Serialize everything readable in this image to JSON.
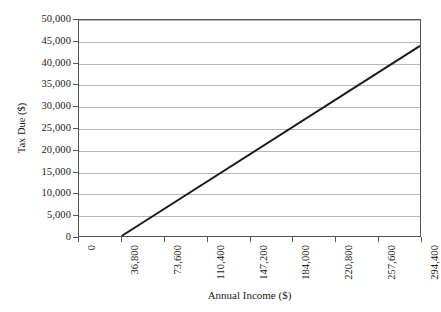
{
  "chart_data": {
    "type": "line",
    "title": "",
    "xlabel": "Annual Income ($)",
    "ylabel": "Tax Due ($)",
    "xlim": [
      0,
      294400
    ],
    "ylim": [
      0,
      50000
    ],
    "grid": true,
    "legend": false,
    "legend_position": "none",
    "x_tick_labels": [
      "0",
      "36,800",
      "73,600",
      "110,400",
      "147,200",
      "184,000",
      "220,800",
      "257,600",
      "294,400"
    ],
    "x_tick_values": [
      0,
      36800,
      73600,
      110400,
      147200,
      184000,
      220800,
      257600,
      294400
    ],
    "y_tick_labels": [
      "0",
      "5,000",
      "10,000",
      "15,000",
      "20,000",
      "25,000",
      "30,000",
      "35,000",
      "40,000",
      "45,000",
      "50,000"
    ],
    "y_tick_values": [
      0,
      5000,
      10000,
      15000,
      20000,
      25000,
      30000,
      35000,
      40000,
      45000,
      50000
    ],
    "series": [
      {
        "name": "Tax Due",
        "color": "#1a1a1a",
        "line_width": 2,
        "x": [
          36800,
          294400
        ],
        "values": [
          0,
          44000
        ]
      }
    ],
    "annotations": []
  },
  "axes": {
    "x_title": "Annual Income ($)",
    "y_title": "Tax Due ($)"
  },
  "style": {
    "background": "#ffffff",
    "grid_color": "#b8b8b8",
    "axis_color": "#555555",
    "line_color": "#1a1a1a",
    "text_color": "#1a1a1a"
  }
}
